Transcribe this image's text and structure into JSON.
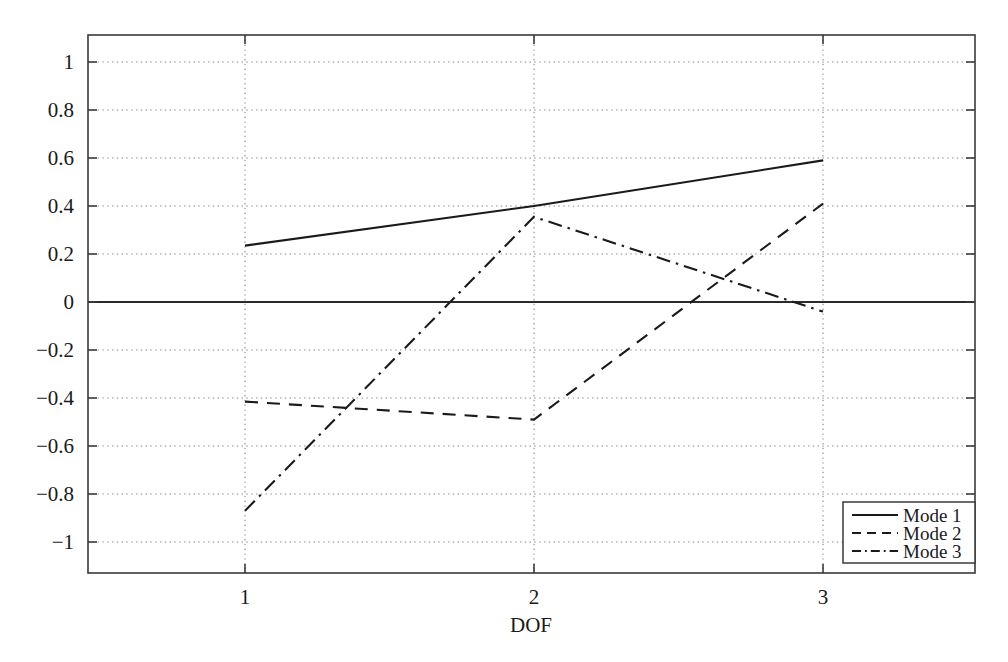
{
  "chart_data": {
    "type": "line",
    "title": "",
    "xlabel": "DOF",
    "ylabel": "",
    "x": [
      1,
      2,
      3
    ],
    "xtick_labels": [
      "1",
      "2",
      "3"
    ],
    "ytick_labels": [
      "1",
      "0.8",
      "0.6",
      "0.4",
      "0.2",
      "0",
      "−0.2",
      "−0.4",
      "−0.6",
      "−0.8",
      "−1"
    ],
    "ytick_values": [
      1,
      0.8,
      0.6,
      0.4,
      0.2,
      0,
      -0.2,
      -0.4,
      -0.6,
      -0.8,
      -1
    ],
    "xlim": [
      0.46,
      3.52
    ],
    "ylim": [
      -1.2,
      1.14
    ],
    "grid": true,
    "legend_position": "lower-right",
    "series": [
      {
        "name": "Mode 1",
        "style": "solid",
        "values": [
          0.235,
          0.4,
          0.59
        ]
      },
      {
        "name": "Mode 2",
        "style": "dashed",
        "values": [
          -0.415,
          -0.49,
          0.41
        ]
      },
      {
        "name": "Mode 3",
        "style": "dashdot",
        "values": [
          -0.87,
          0.355,
          -0.04
        ]
      }
    ],
    "colors": {
      "line": "#1a1a1a",
      "grid": "#8a8a8a",
      "frame": "#3a3a3a",
      "background": "#ffffff"
    }
  },
  "axes": {
    "x_title": "DOF"
  },
  "legend": {
    "entries": [
      {
        "label": "Mode 1"
      },
      {
        "label": "Mode 2"
      },
      {
        "label": "Mode 3"
      }
    ]
  }
}
